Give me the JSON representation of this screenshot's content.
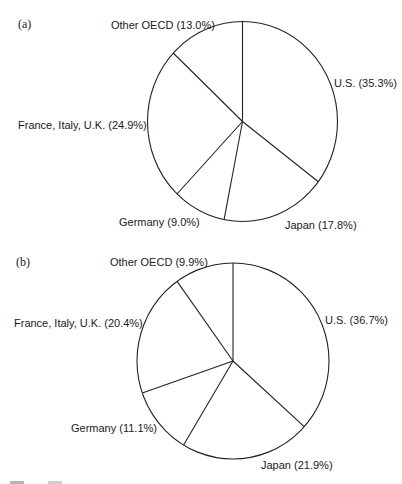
{
  "chart_data": [
    {
      "type": "pie",
      "panel_label": "(a)",
      "start_angle_deg": 0,
      "direction": "clockwise",
      "categories": [
        "U.S.",
        "Japan",
        "Germany",
        "France, Italy, U.K.",
        "Other OECD"
      ],
      "values": [
        35.3,
        17.8,
        9.0,
        24.9,
        13.0
      ],
      "labels": [
        "U.S. (35.3%)",
        "Japan (17.8%)",
        "Germany (9.0%)",
        "France, Italy, U.K. (24.9%)",
        "Other OECD (13.0%)"
      ],
      "geometry": {
        "cx": 242.5,
        "cy": 121.5,
        "rx": 95,
        "ry": 100
      },
      "label_positions": [
        {
          "x": 334,
          "y": 87,
          "anchor": "start"
        },
        {
          "x": 285,
          "y": 229,
          "anchor": "start"
        },
        {
          "x": 119,
          "y": 226,
          "anchor": "start"
        },
        {
          "x": 18,
          "y": 129,
          "anchor": "start"
        },
        {
          "x": 111,
          "y": 29,
          "anchor": "start"
        }
      ],
      "panel_label_position": {
        "x": 18,
        "y": 28
      }
    },
    {
      "type": "pie",
      "panel_label": "(b)",
      "start_angle_deg": 0,
      "direction": "clockwise",
      "categories": [
        "U.S.",
        "Japan",
        "Germany",
        "France, Italy, U.K.",
        "Other OECD"
      ],
      "values": [
        36.7,
        21.9,
        11.1,
        20.4,
        9.9
      ],
      "labels": [
        "U.S. (36.7%)",
        "Japan (21.9%)",
        "Germany (11.1%)",
        "France, Italy, U.K. (20.4%)",
        "Other OECD (9.9%)"
      ],
      "geometry": {
        "cx": 233,
        "cy": 361,
        "rx": 96,
        "ry": 98
      },
      "label_positions": [
        {
          "x": 325,
          "y": 324
        },
        {
          "x": 261,
          "y": 469
        },
        {
          "x": 71,
          "y": 432
        },
        {
          "x": 14,
          "y": 327
        },
        {
          "x": 110,
          "y": 266
        }
      ],
      "panel_label_position": {
        "x": 16,
        "y": 266
      }
    }
  ],
  "colors": {
    "stroke": "#222222",
    "fill": "#ffffff",
    "text": "#1a1a1a"
  }
}
